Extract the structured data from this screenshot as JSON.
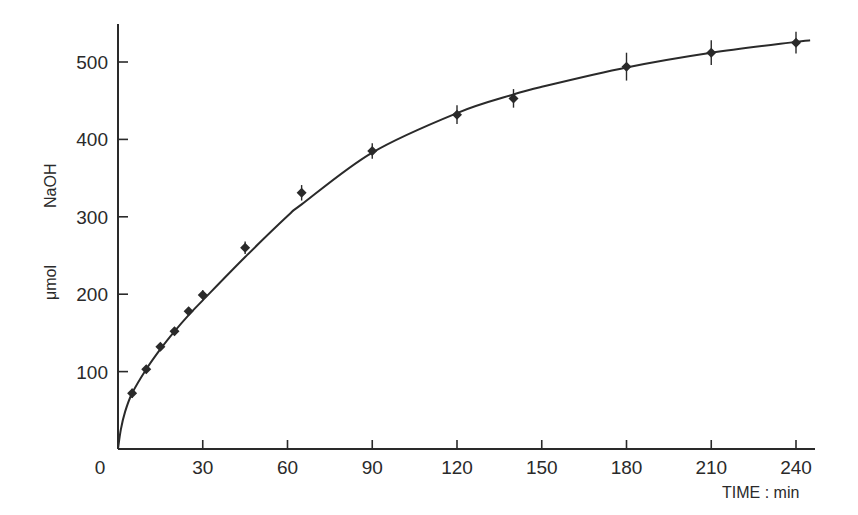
{
  "chart_data": {
    "type": "scatter",
    "title": "",
    "xlabel": "TIME : min",
    "ylabel_parts": [
      "μmol",
      "NaOH"
    ],
    "ylabel": "μmol NaOH",
    "xlim": [
      0,
      245
    ],
    "ylim": [
      0,
      555
    ],
    "grid": false,
    "legend": null,
    "x_ticks": [
      0,
      30,
      60,
      90,
      120,
      150,
      180,
      210,
      240
    ],
    "y_ticks": [
      100,
      200,
      300,
      400,
      500
    ],
    "series": [
      {
        "name": "measured",
        "marker": "diamond",
        "error_bars": true,
        "x": [
          5,
          10,
          15,
          20,
          25,
          30,
          45,
          65,
          90,
          120,
          140,
          180,
          210,
          240
        ],
        "y": [
          72,
          103,
          132,
          152,
          178,
          199,
          260,
          331,
          385,
          432,
          453,
          494,
          512,
          525
        ],
        "err": [
          6,
          5,
          5,
          5,
          5,
          6,
          8,
          10,
          10,
          12,
          12,
          18,
          16,
          14
        ]
      },
      {
        "name": "fitted curve",
        "line": "solid",
        "x": [
          0,
          1,
          2.5,
          5,
          10,
          15,
          20,
          25,
          30,
          45,
          60,
          65,
          90,
          120,
          140,
          150,
          180,
          210,
          240,
          245
        ],
        "y": [
          0,
          25,
          48,
          72,
          103,
          129,
          152,
          173,
          192,
          248,
          301,
          316,
          383,
          434,
          458,
          468,
          493,
          512,
          526,
          528
        ]
      }
    ]
  },
  "axes": {
    "x_tick_labels": [
      "0",
      "30",
      "60",
      "90",
      "120",
      "150",
      "180",
      "210",
      "240"
    ],
    "y_tick_labels": [
      "100",
      "200",
      "300",
      "400",
      "500"
    ],
    "x_title": "TIME : min",
    "y_title_unit": "μmol",
    "y_title_substance": "NaOH"
  },
  "colors": {
    "ink": "#2a2a2a",
    "background": "#ffffff"
  }
}
